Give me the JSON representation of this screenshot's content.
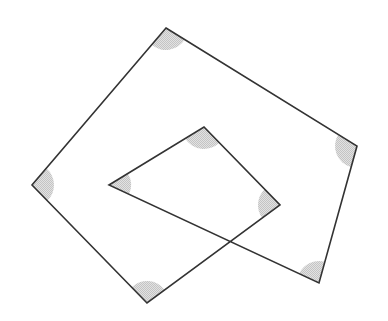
{
  "diagram": {
    "stroke_color": "#333333",
    "shade_color": "#d2d2d2",
    "marker_radius": 22,
    "vertices": [
      {
        "id": "A",
        "x": 166,
        "y": 28
      },
      {
        "id": "B",
        "x": 357,
        "y": 146
      },
      {
        "id": "C",
        "x": 319,
        "y": 283
      },
      {
        "id": "D",
        "x": 109,
        "y": 185
      },
      {
        "id": "E",
        "x": 204,
        "y": 127
      },
      {
        "id": "F",
        "x": 280,
        "y": 205
      },
      {
        "id": "G",
        "x": 147,
        "y": 303
      },
      {
        "id": "H",
        "x": 32,
        "y": 185
      }
    ],
    "crossing_point": {
      "x": 230,
      "y": 241
    }
  }
}
